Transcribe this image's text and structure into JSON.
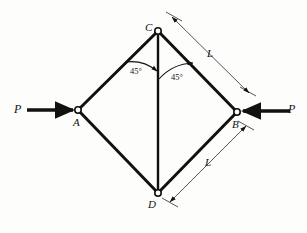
{
  "figure": {
    "type": "statics-truss-diagram",
    "background_color": "#fdfdfc",
    "ink_color": "#111111",
    "nodes": [
      {
        "id": "A",
        "label": "A",
        "x": 78,
        "y": 110,
        "marker": "pin-circle"
      },
      {
        "id": "B",
        "label": "B",
        "x": 237,
        "y": 112,
        "marker": "pin-circle"
      },
      {
        "id": "C",
        "label": "C",
        "x": 158,
        "y": 31,
        "marker": "pin-circle"
      },
      {
        "id": "D",
        "label": "D",
        "x": 158,
        "y": 193,
        "marker": "pin-circle"
      }
    ],
    "members": [
      {
        "from": "C",
        "to": "A"
      },
      {
        "from": "C",
        "to": "B"
      },
      {
        "from": "A",
        "to": "D"
      },
      {
        "from": "D",
        "to": "B"
      },
      {
        "from": "C",
        "to": "D"
      }
    ],
    "forces": [
      {
        "label": "P",
        "at_node": "A",
        "direction": "right",
        "label_x": 14,
        "label_y": 104
      },
      {
        "label": "P",
        "at_node": "B",
        "direction": "left",
        "label_x": 288,
        "label_y": 104
      }
    ],
    "angles": [
      {
        "label": "45°",
        "at_node": "C",
        "side": "left",
        "label_x": 130,
        "label_y": 69
      },
      {
        "label": "45°",
        "at_node": "C",
        "side": "right",
        "label_x": 171,
        "label_y": 74
      }
    ],
    "dimensions": [
      {
        "label": "L",
        "member": "C-B",
        "label_x": 207,
        "label_y": 51
      },
      {
        "label": "L",
        "member": "D-B",
        "label_x": 205,
        "label_y": 159
      }
    ]
  }
}
